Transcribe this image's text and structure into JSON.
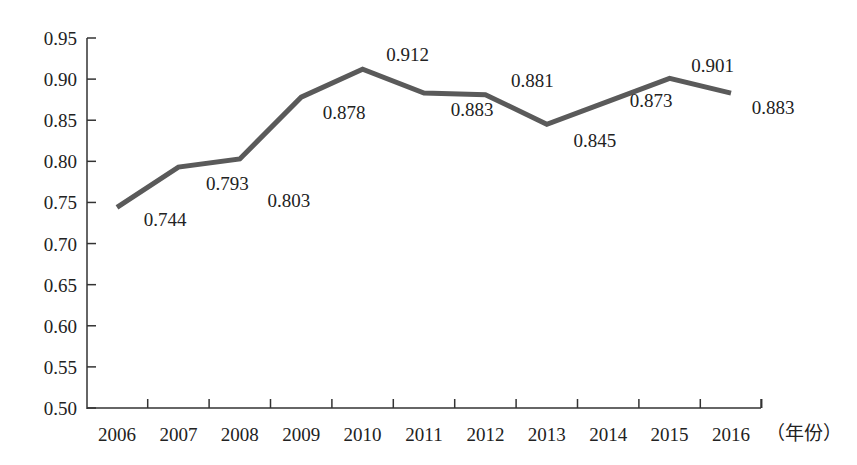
{
  "chart_data": {
    "type": "line",
    "title": "",
    "xlabel": "（年份）",
    "ylabel": "",
    "categories": [
      "2006",
      "2007",
      "2008",
      "2009",
      "2010",
      "2011",
      "2012",
      "2013",
      "2014",
      "2015",
      "2016"
    ],
    "series": [
      {
        "name": "value",
        "values": [
          0.744,
          0.793,
          0.803,
          0.878,
          0.912,
          0.883,
          0.881,
          0.845,
          0.873,
          0.901,
          0.883
        ],
        "color": "#5a5a5a"
      }
    ],
    "data_labels": [
      "0.744",
      "0.793",
      "0.803",
      "0.878",
      "0.912",
      "0.883",
      "0.881",
      "0.845",
      "0.873",
      "0.901",
      "0.883"
    ],
    "ylim": [
      0.5,
      0.95
    ],
    "yticks": [
      "0.50",
      "0.55",
      "0.60",
      "0.65",
      "0.70",
      "0.75",
      "0.80",
      "0.85",
      "0.90",
      "0.95"
    ],
    "grid": false,
    "legend": "none"
  }
}
